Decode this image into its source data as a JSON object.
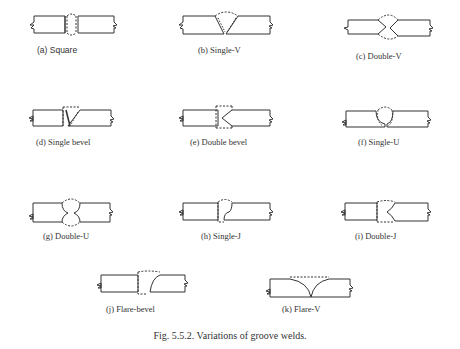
{
  "figure": {
    "caption": "Fig. 5.5.2.  Variations of groove welds.",
    "panels": [
      {
        "id": "a",
        "label": "(a)   Square"
      },
      {
        "id": "b",
        "label": "(b)  Single-V"
      },
      {
        "id": "c",
        "label": "(c)  Double-V"
      },
      {
        "id": "d",
        "label": "(d)  Single bevel"
      },
      {
        "id": "e",
        "label": "(e)  Double bevel"
      },
      {
        "id": "f",
        "label": "(f)  Single-U"
      },
      {
        "id": "g",
        "label": "(g)  Double-U"
      },
      {
        "id": "h",
        "label": "(h)  Single-J"
      },
      {
        "id": "i",
        "label": "(i)  Double-J"
      },
      {
        "id": "j",
        "label": "(j)  Flare-bevel"
      },
      {
        "id": "k",
        "label": "(k)  Flare-V"
      }
    ]
  }
}
